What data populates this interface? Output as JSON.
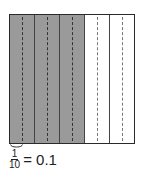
{
  "diagram": {
    "type": "decimal grid (tenths)",
    "columns_solid": 5,
    "tenths_total": 10,
    "tenths_shaded": 6,
    "shade_color": "#9a9a9a",
    "line_color": "#2a2a2a",
    "columns": [
      {
        "shaded": true
      },
      {
        "shaded": true
      },
      {
        "shaded": true
      },
      {
        "shaded": false
      },
      {
        "shaded": false
      }
    ]
  },
  "label": {
    "fraction_numerator": "1",
    "fraction_denominator": "10",
    "equals": "= 0.1"
  }
}
